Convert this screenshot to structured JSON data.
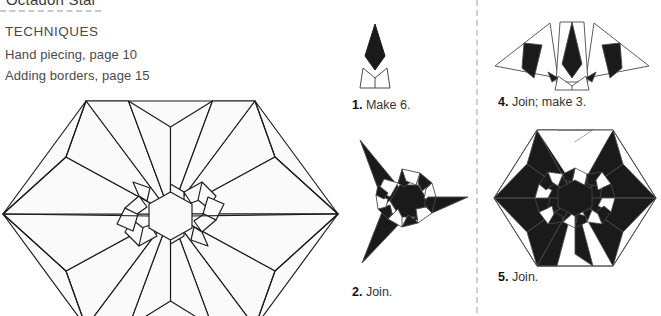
{
  "page": {
    "cut_off_title": "Octagon Star",
    "background": "#ffffff",
    "ink": "#1a1a1a",
    "rule_color": "#c9c9c9"
  },
  "techniques": {
    "heading": "TECHNIQUES",
    "items": [
      "Hand piecing, page 10",
      "Adding borders, page 15"
    ]
  },
  "steps": [
    {
      "number": "1.",
      "text": "Make 6.",
      "name": "step-1-make-6"
    },
    {
      "number": "2.",
      "text": "Join.",
      "name": "step-2-join"
    },
    {
      "number": "4.",
      "text": "Join; make 3.",
      "name": "step-4-join-make-3"
    },
    {
      "number": "5.",
      "text": "Join.",
      "name": "step-5-join"
    }
  ],
  "diagram": {
    "main_label": "twelve-point star in hexagon line drawing",
    "piece_fill_light": "#fafafa",
    "piece_fill_dark": "#1a1a1a",
    "outline": "#1a1a1a"
  }
}
